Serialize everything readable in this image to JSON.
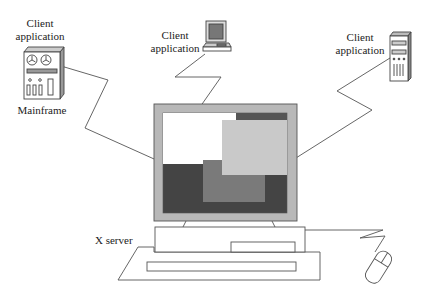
{
  "diagram": {
    "nodes": {
      "mainframe": {
        "label_top": "Client",
        "label_bottom": "application",
        "caption": "Mainframe"
      },
      "workstation": {
        "label_top": "Client",
        "label_bottom": "application"
      },
      "tower": {
        "label_top": "Client",
        "label_bottom": "application"
      },
      "xserver": {
        "label": "X server"
      }
    },
    "colors": {
      "line": "#555555",
      "bezel": "#b8b8b8",
      "dark_window": "#444444",
      "mid_window": "#7a7a7a",
      "light_window": "#c9c9c9",
      "white_window": "#ffffff"
    }
  }
}
